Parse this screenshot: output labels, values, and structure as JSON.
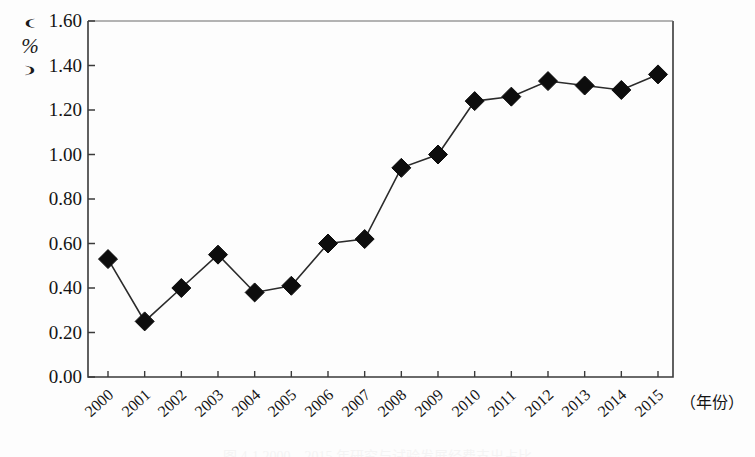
{
  "chart_data": {
    "type": "line",
    "title": "",
    "xlabel": "（年份）",
    "ylabel": "（%）",
    "y_unit_paren_open": "︵",
    "y_unit_symbol": "%",
    "y_unit_paren_close": "︶",
    "categories": [
      "2000",
      "2001",
      "2002",
      "2003",
      "2004",
      "2005",
      "2006",
      "2007",
      "2008",
      "2009",
      "2010",
      "2011",
      "2012",
      "2013",
      "2014",
      "2015"
    ],
    "values": [
      0.53,
      0.25,
      0.4,
      0.55,
      0.38,
      0.41,
      0.6,
      0.62,
      0.94,
      1.0,
      1.24,
      1.26,
      1.33,
      1.31,
      1.29,
      1.36
    ],
    "ylim": [
      0.0,
      1.6
    ],
    "ytick_values": [
      0.0,
      0.2,
      0.4,
      0.6,
      0.8,
      1.0,
      1.2,
      1.4,
      1.6
    ],
    "ytick_labels": [
      "0.00",
      "0.20",
      "0.40",
      "0.60",
      "0.80",
      "1.00",
      "1.20",
      "1.40",
      "1.60"
    ],
    "grid": false,
    "legend": "none",
    "marker": "diamond",
    "marker_color": "#0d0d0d",
    "line_color": "#2b2b2b",
    "axis_color": "#3a3a3a",
    "series_name": ""
  },
  "caption": {
    "text": "图 4-1 2000—2015 年研究与试验发展经费支出占比"
  }
}
